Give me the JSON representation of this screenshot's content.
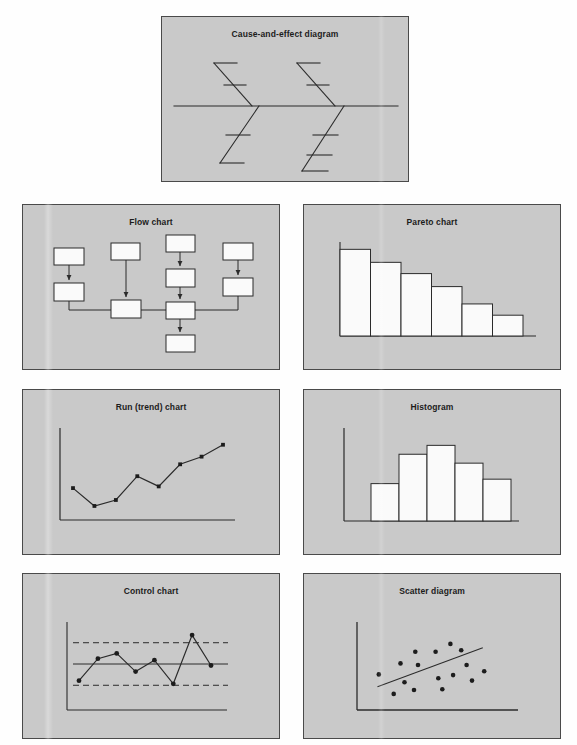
{
  "figure": {
    "background_color": "#fefefe",
    "panel_color": "#c9c9c9",
    "panel_border_color": "#4a4a4a",
    "ink_color": "#2b2b2b",
    "shape_fill_color": "#fafafa"
  },
  "panels": {
    "fishbone": {
      "title": "Cause-and-effect diagram",
      "type": "diagram",
      "spine": {
        "x1": 12,
        "y1": 89,
        "x2": 236,
        "y2": 89
      },
      "upper_bones": [
        {
          "x1": 52,
          "y1": 46,
          "x2": 90,
          "y2": 89,
          "ribs": [
            {
              "x1": 52,
              "y1": 46,
              "x2": 75,
              "y2": 46
            },
            {
              "x1": 62,
              "y1": 68,
              "x2": 84,
              "y2": 68
            }
          ]
        },
        {
          "x1": 135,
          "y1": 46,
          "x2": 173,
          "y2": 89,
          "ribs": [
            {
              "x1": 135,
              "y1": 46,
              "x2": 158,
              "y2": 46
            },
            {
              "x1": 145,
              "y1": 68,
              "x2": 167,
              "y2": 68
            }
          ]
        }
      ],
      "lower_bones": [
        {
          "x1": 58,
          "y1": 146,
          "x2": 97,
          "y2": 89,
          "ribs": [
            {
              "x1": 64,
              "y1": 118,
              "x2": 88,
              "y2": 118
            },
            {
              "x1": 58,
              "y1": 146,
              "x2": 82,
              "y2": 146
            }
          ]
        },
        {
          "x1": 140,
          "y1": 154,
          "x2": 182,
          "y2": 89,
          "ribs": [
            {
              "x1": 151,
              "y1": 118,
              "x2": 176,
              "y2": 118
            },
            {
              "x1": 145,
              "y1": 138,
              "x2": 170,
              "y2": 138
            },
            {
              "x1": 140,
              "y1": 154,
              "x2": 166,
              "y2": 154
            }
          ]
        }
      ]
    },
    "flow": {
      "title": "Flow chart",
      "type": "diagram",
      "boxes": [
        {
          "id": "b1",
          "x": 31,
          "y": 43,
          "w": 30,
          "h": 17
        },
        {
          "id": "b2",
          "x": 31,
          "y": 78,
          "w": 30,
          "h": 18
        },
        {
          "id": "b3",
          "x": 88,
          "y": 38,
          "w": 29,
          "h": 17
        },
        {
          "id": "b4",
          "x": 88,
          "y": 95,
          "w": 30,
          "h": 18
        },
        {
          "id": "b5",
          "x": 143,
          "y": 30,
          "w": 29,
          "h": 17
        },
        {
          "id": "b6",
          "x": 143,
          "y": 64,
          "w": 29,
          "h": 18
        },
        {
          "id": "b7",
          "x": 143,
          "y": 97,
          "w": 29,
          "h": 17
        },
        {
          "id": "b8",
          "x": 143,
          "y": 130,
          "w": 29,
          "h": 17
        },
        {
          "id": "b9",
          "x": 200,
          "y": 38,
          "w": 30,
          "h": 17
        },
        {
          "id": "b10",
          "x": 200,
          "y": 73,
          "w": 30,
          "h": 18
        }
      ],
      "arrows": [
        {
          "from": "b1",
          "to": "b2"
        },
        {
          "from": "b3",
          "to": "b4"
        },
        {
          "from": "b5",
          "to": "b6"
        },
        {
          "from": "b6",
          "to": "b7"
        },
        {
          "from": "b7",
          "to": "b8"
        },
        {
          "from": "b9",
          "to": "b10"
        }
      ],
      "connectors": [
        {
          "points": "46,96 46,105 88,105"
        },
        {
          "points": "118,105 143,105"
        },
        {
          "points": "172,105 215,105 215,91"
        }
      ]
    },
    "pareto": {
      "title": "Pareto chart"
    },
    "run": {
      "title": "Run (trend) chart"
    },
    "histogram": {
      "title": "Histogram"
    },
    "control": {
      "title": "Control chart"
    },
    "scatter": {
      "title": "Scatter diagram"
    }
  },
  "chart_data": [
    {
      "id": "pareto",
      "type": "bar",
      "title": "Pareto chart",
      "xlabel": "",
      "ylabel": "",
      "grid": false,
      "legend": "none",
      "categories": [
        "1",
        "2",
        "3",
        "4",
        "5",
        "6"
      ],
      "values": [
        100,
        85,
        72,
        57,
        37,
        24
      ],
      "ylim": [
        0,
        105
      ],
      "note": "bars sorted descending, frequency (relative units)"
    },
    {
      "id": "run",
      "type": "line",
      "title": "Run (trend) chart",
      "xlabel": "",
      "ylabel": "",
      "grid": false,
      "legend": "none",
      "markers": true,
      "x": [
        1,
        2,
        3,
        4,
        5,
        6,
        7,
        8
      ],
      "values": [
        34,
        13,
        20,
        48,
        36,
        62,
        71,
        85
      ],
      "ylim": [
        0,
        100
      ],
      "note": "upward trend with markers at each observation"
    },
    {
      "id": "histogram",
      "type": "bar",
      "title": "Histogram",
      "xlabel": "",
      "ylabel": "",
      "grid": false,
      "legend": "none",
      "categories": [
        "1",
        "2",
        "3",
        "4",
        "5"
      ],
      "values": [
        42,
        75,
        85,
        65,
        47
      ],
      "ylim": [
        0,
        100
      ],
      "note": "adjacent bars, roughly bell-shaped distribution"
    },
    {
      "id": "control",
      "type": "line",
      "title": "Control chart",
      "xlabel": "",
      "ylabel": "",
      "grid": false,
      "legend": "none",
      "markers": true,
      "x": [
        1,
        2,
        3,
        4,
        5,
        6,
        7,
        8
      ],
      "values": [
        28,
        57,
        64,
        40,
        55,
        24,
        88,
        48
      ],
      "center_line": 50,
      "upper_control_limit": 78,
      "lower_control_limit": 22,
      "ylim": [
        0,
        100
      ],
      "note": "point 7 exceeds the upper control limit"
    },
    {
      "id": "scatter",
      "type": "scatter",
      "title": "Scatter diagram",
      "xlabel": "",
      "ylabel": "",
      "grid": false,
      "legend": "none",
      "trend_line": {
        "x1": 10,
        "y1": 22,
        "x2": 88,
        "y2": 72
      },
      "points": [
        {
          "x": 11,
          "y": 38
        },
        {
          "x": 22,
          "y": 13
        },
        {
          "x": 27,
          "y": 52
        },
        {
          "x": 30,
          "y": 28
        },
        {
          "x": 37,
          "y": 18
        },
        {
          "x": 38,
          "y": 67
        },
        {
          "x": 40,
          "y": 50
        },
        {
          "x": 53,
          "y": 67
        },
        {
          "x": 55,
          "y": 33
        },
        {
          "x": 58,
          "y": 19
        },
        {
          "x": 64,
          "y": 77
        },
        {
          "x": 66,
          "y": 37
        },
        {
          "x": 72,
          "y": 69
        },
        {
          "x": 76,
          "y": 50
        },
        {
          "x": 80,
          "y": 30
        },
        {
          "x": 89,
          "y": 42
        }
      ],
      "ylim": [
        0,
        100
      ],
      "xlim": [
        0,
        100
      ],
      "note": "positive correlation with fitted straight line"
    }
  ]
}
